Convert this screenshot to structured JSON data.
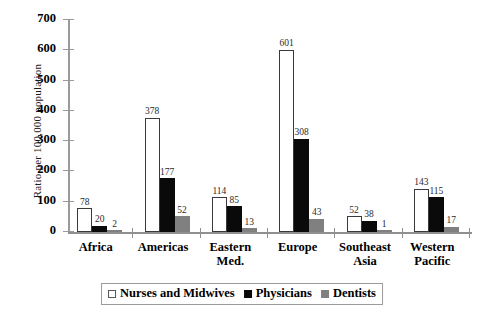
{
  "chart_data": {
    "type": "bar",
    "title": "",
    "xlabel": "",
    "ylabel": "Ratio per 100,000 population",
    "ylim": [
      0,
      700
    ],
    "yticks": [
      0,
      100,
      200,
      300,
      400,
      500,
      600,
      700
    ],
    "grid": false,
    "legend_position": "bottom",
    "categories": [
      "Africa",
      "Americas",
      "Eastern Med.",
      "Europe",
      "Southeast Asia",
      "Western Pacific"
    ],
    "category_lines": [
      {
        "line1": "Africa",
        "line2": ""
      },
      {
        "line1": "Americas",
        "line2": ""
      },
      {
        "line1": "Eastern",
        "line2": "Med."
      },
      {
        "line1": "Europe",
        "line2": ""
      },
      {
        "line1": "Southeast",
        "line2": "Asia"
      },
      {
        "line1": "Western",
        "line2": "Pacific"
      }
    ],
    "series": [
      {
        "name": "Nurses and Midwives",
        "color": "#ffffff",
        "values": [
          78,
          378,
          114,
          601,
          52,
          143
        ]
      },
      {
        "name": "Physicians",
        "color": "#0a0a0a",
        "values": [
          20,
          177,
          85,
          308,
          38,
          115
        ]
      },
      {
        "name": "Dentists",
        "color": "#808080",
        "values": [
          2,
          52,
          13,
          43,
          1,
          17
        ]
      }
    ]
  },
  "legend": {
    "items": [
      {
        "label": "Nurses and Midwives",
        "swatch": "nurses"
      },
      {
        "label": "Physicians",
        "swatch": "physicians"
      },
      {
        "label": "Dentists",
        "swatch": "dentists"
      }
    ]
  },
  "footer": {
    "caption": ""
  }
}
